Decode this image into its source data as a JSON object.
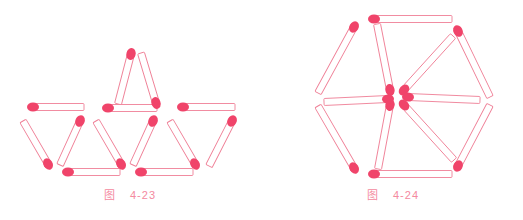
{
  "page": {
    "width": 523,
    "height": 220,
    "background": "#ffffff",
    "kind": "matchstick-puzzle-illustration"
  },
  "style": {
    "match_head_color": "#f0446a",
    "match_head_color_light": "#f4647f",
    "match_stick_outline": "#ef7f96",
    "match_stick_fill": "#ffffff",
    "caption_color": "#f48aa0",
    "stroke_width": 0.9,
    "stick_width": 7,
    "head_rx": 4.6,
    "head_ry": 6.0
  },
  "figures": [
    {
      "id": "fig-4-23",
      "name": "triangles-matchstick-figure",
      "caption_cn": "图",
      "caption_num": "4-23",
      "description": "Matchsticks arranged as one upward triangle on top and three upward triangles in a bottom row, 12 matches total plus separators.",
      "viewbox": "0 0 262 220",
      "matches": [
        {
          "id": "t1-left",
          "x1": 118,
          "y1": 104,
          "x2": 131,
          "y2": 54,
          "head": "x2",
          "group": "top-triangle"
        },
        {
          "id": "t1-right",
          "x1": 141,
          "y1": 53,
          "x2": 156,
          "y2": 103,
          "head": "x2",
          "group": "top-triangle"
        },
        {
          "id": "t1-bottom",
          "x1": 108,
          "y1": 108,
          "x2": 157,
          "y2": 108,
          "head": "x1",
          "group": "top-triangle"
        },
        {
          "id": "mid-bar-left",
          "x1": 33,
          "y1": 107,
          "x2": 84,
          "y2": 107,
          "head": "x1",
          "group": "middle-row"
        },
        {
          "id": "mid-bar-right",
          "x1": 183,
          "y1": 107,
          "x2": 235,
          "y2": 107,
          "head": "x1",
          "group": "middle-row"
        },
        {
          "id": "t2-left",
          "x1": 23,
          "y1": 121,
          "x2": 48,
          "y2": 164,
          "head": "x2",
          "group": "bottom-triangle-1"
        },
        {
          "id": "t2-right",
          "x1": 80,
          "y1": 121,
          "x2": 60,
          "y2": 165,
          "head": "x1",
          "group": "bottom-triangle-1"
        },
        {
          "id": "t2-bottom",
          "x1": 68,
          "y1": 172,
          "x2": 120,
          "y2": 172,
          "head": "x1",
          "group": "bottom-triangle-1"
        },
        {
          "id": "t3-left",
          "x1": 96,
          "y1": 121,
          "x2": 121,
          "y2": 164,
          "head": "x2",
          "group": "bottom-triangle-2"
        },
        {
          "id": "t3-right",
          "x1": 153,
          "y1": 121,
          "x2": 133,
          "y2": 165,
          "head": "x1",
          "group": "bottom-triangle-2"
        },
        {
          "id": "t3-bottom",
          "x1": 141,
          "y1": 172,
          "x2": 193,
          "y2": 172,
          "head": "x1",
          "group": "bottom-triangle-2"
        },
        {
          "id": "t4-left",
          "x1": 170,
          "y1": 121,
          "x2": 195,
          "y2": 164,
          "head": "x2",
          "group": "bottom-triangle-3"
        },
        {
          "id": "t4-right",
          "x1": 232,
          "y1": 121,
          "x2": 209,
          "y2": 166,
          "head": "x1",
          "group": "bottom-triangle-3"
        }
      ]
    },
    {
      "id": "fig-4-24",
      "name": "hexagon-matchstick-figure",
      "caption_cn": "图",
      "caption_num": "4-24",
      "description": "Regular hexagon of six matchsticks with six spokes radiating from the centre; every spoke head meets at the centre.",
      "viewbox": "0 0 261 220",
      "center": {
        "x": 136,
        "y": 97
      },
      "hexagon_vertices": [
        {
          "x": 110,
          "y": 19
        },
        {
          "x": 192,
          "y": 32
        },
        {
          "x": 222,
          "y": 100
        },
        {
          "x": 193,
          "y": 163
        },
        {
          "x": 110,
          "y": 173
        },
        {
          "x": 58,
          "y": 99
        }
      ],
      "matches": [
        {
          "id": "hex-top",
          "x1": 112,
          "y1": 19,
          "x2": 190,
          "y2": 19,
          "head": "x1",
          "group": "perimeter"
        },
        {
          "id": "hex-upper-right",
          "x1": 196,
          "y1": 31,
          "x2": 228,
          "y2": 97,
          "head": "x1",
          "group": "perimeter"
        },
        {
          "id": "hex-lower-right",
          "x1": 228,
          "y1": 105,
          "x2": 196,
          "y2": 166,
          "head": "x2",
          "group": "perimeter"
        },
        {
          "id": "hex-bottom",
          "x1": 112,
          "y1": 174,
          "x2": 190,
          "y2": 174,
          "head": "x1",
          "group": "perimeter"
        },
        {
          "id": "hex-lower-left",
          "x1": 56,
          "y1": 106,
          "x2": 92,
          "y2": 168,
          "head": "x2",
          "group": "perimeter"
        },
        {
          "id": "hex-upper-left",
          "x1": 92,
          "y1": 27,
          "x2": 56,
          "y2": 93,
          "head": "x1",
          "group": "perimeter"
        },
        {
          "id": "spoke-n",
          "x1": 128,
          "y1": 90,
          "x2": 115,
          "y2": 24,
          "head": "x1",
          "group": "spoke"
        },
        {
          "id": "spoke-ne",
          "x1": 142,
          "y1": 90,
          "x2": 191,
          "y2": 36,
          "head": "x1",
          "group": "spoke"
        },
        {
          "id": "spoke-e",
          "x1": 146,
          "y1": 97,
          "x2": 218,
          "y2": 100,
          "head": "x1",
          "group": "spoke"
        },
        {
          "id": "spoke-se",
          "x1": 142,
          "y1": 105,
          "x2": 192,
          "y2": 160,
          "head": "x1",
          "group": "spoke"
        },
        {
          "id": "spoke-s",
          "x1": 128,
          "y1": 105,
          "x2": 116,
          "y2": 169,
          "head": "x1",
          "group": "spoke"
        },
        {
          "id": "spoke-sw",
          "x1": 126,
          "y1": 99,
          "x2": 62,
          "y2": 102,
          "head": "x1",
          "group": "spoke"
        }
      ]
    }
  ]
}
